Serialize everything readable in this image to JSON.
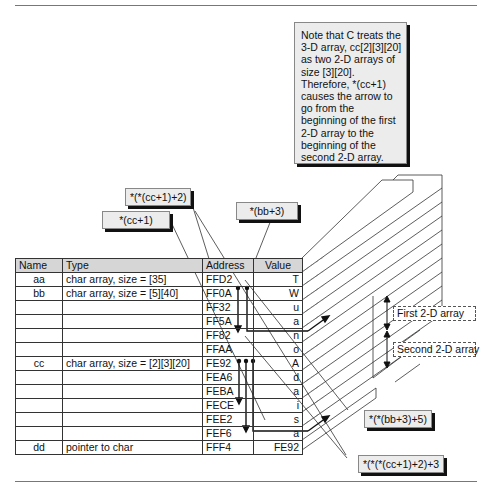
{
  "note": {
    "text": "Note that C treats the 3-D array, cc[2][3][20] as two 2-D arrays of size [3][20].  Therefore, *(cc+1) causes the arrow to go from the beginning of the first 2-D array to the beginning of the second 2-D array."
  },
  "callouts": {
    "cc_plus_1_2": "*(*(cc+1)+2)",
    "cc_plus_1": "*(cc+1)",
    "bb_plus_3": "*(bb+3)",
    "bb_plus_3_5": "*(*(bb+3)+5)",
    "cc_plus_1_2_3": "*(*(*(cc+1)+2)+3"
  },
  "table": {
    "headers": [
      "Name",
      "Type",
      "Address",
      "Value"
    ],
    "rows": [
      {
        "name": "aa",
        "type": "char array, size = [35]",
        "address": "FFD2",
        "value": "T"
      },
      {
        "name": "bb",
        "type": "char array, size = [5][40]",
        "address": "FF0A",
        "value": "W"
      },
      {
        "name": "",
        "type": "",
        "address": "FF32",
        "value": "u"
      },
      {
        "name": "",
        "type": "",
        "address": "FF5A",
        "value": "a"
      },
      {
        "name": "",
        "type": "",
        "address": "FF82",
        "value": "n"
      },
      {
        "name": "",
        "type": "",
        "address": "FFAA",
        "value": "o"
      },
      {
        "name": "cc",
        "type": "char array,  size = [2][3][20]",
        "address": "FE92",
        "value": "A"
      },
      {
        "name": "",
        "type": "",
        "address": "FEA6",
        "value": "d"
      },
      {
        "name": "",
        "type": "",
        "address": "FEBA",
        "value": "a"
      },
      {
        "name": "",
        "type": "",
        "address": "FECE",
        "value": "i"
      },
      {
        "name": "",
        "type": "",
        "address": "FEE2",
        "value": "s"
      },
      {
        "name": "",
        "type": "",
        "address": "FEF6",
        "value": "a"
      },
      {
        "name": "dd",
        "type": "pointer to char",
        "address": "FFF4",
        "value": "FE92"
      }
    ]
  },
  "side_labels": {
    "first": "First 2-D array",
    "second": "Second 2-D array"
  }
}
